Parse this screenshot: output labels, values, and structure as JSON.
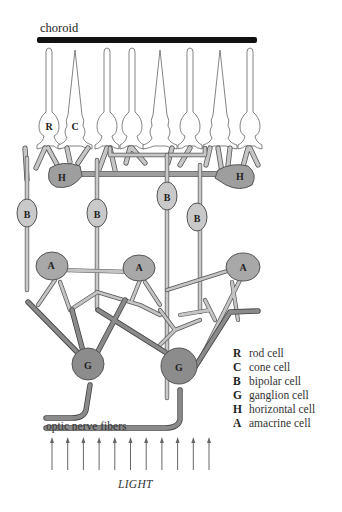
{
  "diagram": {
    "title_label": "choroid",
    "bottom_label": "optic nerve fibers",
    "light_label": "LIGHT",
    "light_arrow_count": 11,
    "colors": {
      "choroid": "#111111",
      "photoreceptor_fill": "#ffffff",
      "photoreceptor_stroke": "#666666",
      "bipolar": "#c9c9c9",
      "horizontal": "#9e9e9e",
      "amacrine": "#a8a8a8",
      "ganglion": "#8c8c8c",
      "process_light": "#c4c4c4",
      "process_dark": "#8a8a8a",
      "outline": "#555555",
      "arrow": "#666666"
    },
    "photoreceptors": [
      {
        "type": "rod",
        "label": "R"
      },
      {
        "type": "cone",
        "label": "C"
      },
      {
        "type": "rod",
        "label": ""
      },
      {
        "type": "rod",
        "label": ""
      },
      {
        "type": "cone",
        "label": ""
      },
      {
        "type": "rod",
        "label": ""
      },
      {
        "type": "cone",
        "label": ""
      },
      {
        "type": "rod",
        "label": ""
      }
    ],
    "cells": {
      "horizontal": [
        "H",
        "H"
      ],
      "bipolar": [
        "B",
        "B",
        "B",
        "B"
      ],
      "amacrine": [
        "A",
        "A",
        "A"
      ],
      "ganglion": [
        "G",
        "G"
      ]
    }
  },
  "legend": {
    "items": [
      {
        "key": "R",
        "label": "rod cell"
      },
      {
        "key": "C",
        "label": "cone cell"
      },
      {
        "key": "B",
        "label": "bipolar cell"
      },
      {
        "key": "G",
        "label": "ganglion cell"
      },
      {
        "key": "H",
        "label": "horizontal cell"
      },
      {
        "key": "A",
        "label": "amacrine cell"
      }
    ]
  }
}
